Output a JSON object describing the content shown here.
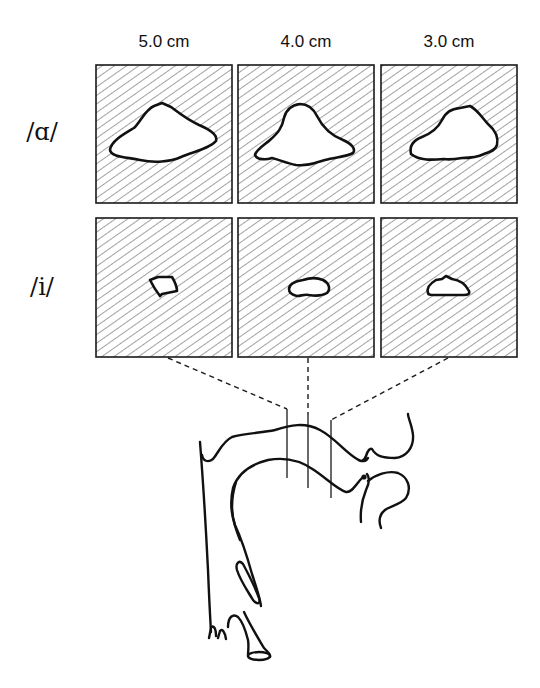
{
  "figure": {
    "type": "vocal-tract cross-section diagram",
    "column_labels": [
      "5.0 cm",
      "4.0 cm",
      "3.0 cm"
    ],
    "row_labels": [
      "/ɑ/",
      "/i/"
    ],
    "rows": [
      {
        "vowel": "/ɑ/",
        "sections": [
          {
            "distance": "5.0 cm",
            "cavity_size": "large"
          },
          {
            "distance": "4.0 cm",
            "cavity_size": "large"
          },
          {
            "distance": "3.0 cm",
            "cavity_size": "large"
          }
        ]
      },
      {
        "vowel": "/i/",
        "sections": [
          {
            "distance": "5.0 cm",
            "cavity_size": "small"
          },
          {
            "distance": "4.0 cm",
            "cavity_size": "small"
          },
          {
            "distance": "3.0 cm",
            "cavity_size": "small"
          }
        ]
      }
    ],
    "midsagittal_sketch": {
      "description": "mid-sagittal outline of the vocal tract with three vertical cut lines linked by dashed lines to the cross-section boxes",
      "cut_lines": 3
    },
    "colors": {
      "ink": "#111111",
      "background": "#ffffff",
      "hatch": "#555555"
    }
  }
}
